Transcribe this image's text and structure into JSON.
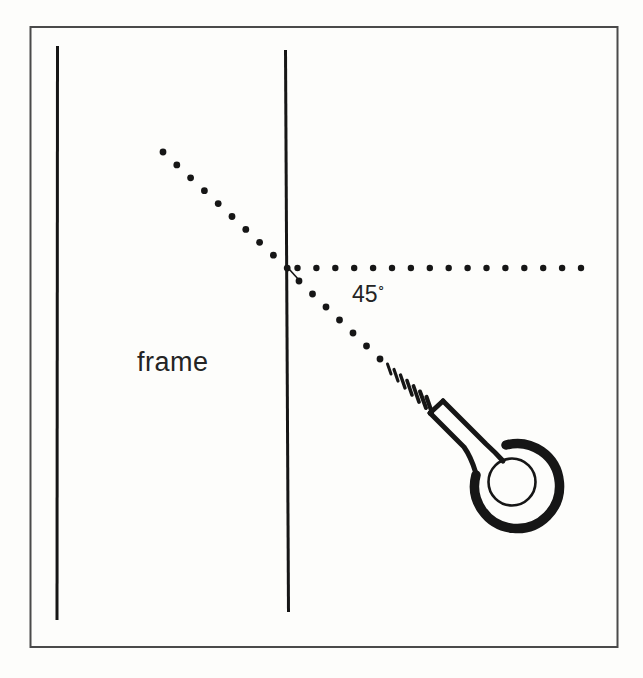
{
  "figure": {
    "type": "reflection-angle-diagram",
    "labels": {
      "frame": "frame",
      "angle_value": "45",
      "degree_symbol": "°"
    },
    "colors": {
      "ink": "#161616",
      "border": "#4a4a4a",
      "paper": "#fdfdfb"
    }
  },
  "diagram": {
    "dotted_paths": [
      {
        "name": "incoming-diagonal",
        "x0": 163,
        "y0": 152,
        "dx": 13.8,
        "dy": 12.9,
        "count": 10,
        "r": 3.4
      },
      {
        "name": "outgoing-horizontal",
        "x0": 297.5,
        "y0": 268,
        "dx": 18.9,
        "dy": 0,
        "count": 16,
        "r": 3.2
      },
      {
        "name": "reflected-diagonal",
        "x0": 299,
        "y0": 281,
        "dx": 13.5,
        "dy": 13,
        "count": 7,
        "r": 3.4
      }
    ],
    "thread_marks": [
      [
        387.5,
        364,
        391,
        374,
        3.0
      ],
      [
        394,
        369.5,
        398,
        381,
        3.2
      ],
      [
        400.5,
        375,
        405,
        388,
        3.4
      ],
      [
        407,
        380.5,
        412,
        395,
        3.6
      ],
      [
        413.5,
        386,
        419,
        402,
        3.8
      ],
      [
        420,
        391.5,
        426,
        408,
        4.0
      ],
      [
        426.5,
        397,
        432,
        413,
        4.2
      ]
    ]
  }
}
